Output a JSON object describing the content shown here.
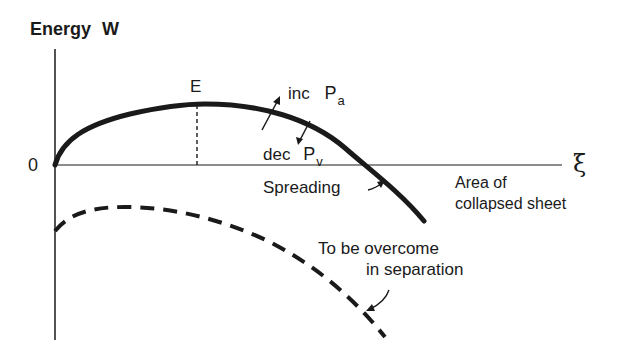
{
  "diagram": {
    "y_axis_label": "Energy W",
    "origin_label": "0",
    "x_axis_symbol": "ξ",
    "x_axis_label_line1": "Area of",
    "x_axis_label_line2": "collapsed sheet",
    "peak_label": "E",
    "annotations": {
      "inc_prefix": "inc",
      "inc_var": "P",
      "inc_sub": "a",
      "dec_prefix": "dec",
      "dec_var": "P",
      "dec_sub": "v",
      "spreading": "Spreading",
      "overcome_line1": "To be overcome",
      "overcome_line2": "in separation"
    },
    "curves": [
      {
        "name": "energy-curve",
        "style": "solid-thick",
        "points": [
          [
            55,
            165
          ],
          [
            80,
            130
          ],
          [
            130,
            112
          ],
          [
            197,
            104
          ],
          [
            250,
            108
          ],
          [
            300,
            125
          ],
          [
            340,
            145
          ],
          [
            368,
            165
          ],
          [
            400,
            192
          ],
          [
            424,
            221
          ]
        ]
      },
      {
        "name": "separation-curve",
        "style": "dashed-thick",
        "points": [
          [
            55,
            231
          ],
          [
            75,
            215
          ],
          [
            120,
            207
          ],
          [
            170,
            210
          ],
          [
            230,
            225
          ],
          [
            290,
            255
          ],
          [
            340,
            290
          ],
          [
            385,
            337
          ]
        ]
      }
    ],
    "colors": {
      "ink": "#1a1a1a",
      "background": "#ffffff"
    }
  }
}
